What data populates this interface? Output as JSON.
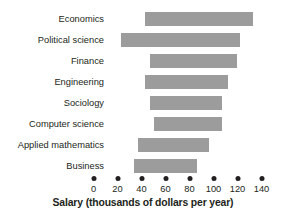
{
  "chart_data": {
    "type": "bar",
    "orientation": "horizontal",
    "subtype": "floating-range-bar",
    "title": "",
    "xlabel": "Salary (thousands of dollars per year)",
    "ylabel": "",
    "xlim": [
      0,
      140
    ],
    "xticks": [
      0,
      20,
      40,
      60,
      80,
      100,
      120,
      140
    ],
    "xtick_labels": [
      "0",
      "20",
      "40",
      "60",
      "80",
      "100",
      "120",
      "140"
    ],
    "grid": false,
    "legend": false,
    "tick_style": "dots",
    "bar_color": "#9c9c9c",
    "text_color": "#231f20",
    "categories": [
      "Economics",
      "Political science",
      "Finance",
      "Engineering",
      "Sociology",
      "Computer science",
      "Applied mathematics",
      "Business"
    ],
    "ranges": [
      {
        "category": "Economics",
        "min": 43,
        "max": 133
      },
      {
        "category": "Political science",
        "min": 23,
        "max": 122
      },
      {
        "category": "Finance",
        "min": 47,
        "max": 120
      },
      {
        "category": "Engineering",
        "min": 43,
        "max": 112
      },
      {
        "category": "Sociology",
        "min": 47,
        "max": 107
      },
      {
        "category": "Computer science",
        "min": 50,
        "max": 107
      },
      {
        "category": "Applied mathematics",
        "min": 37,
        "max": 96
      },
      {
        "category": "Business",
        "min": 34,
        "max": 86
      }
    ]
  }
}
